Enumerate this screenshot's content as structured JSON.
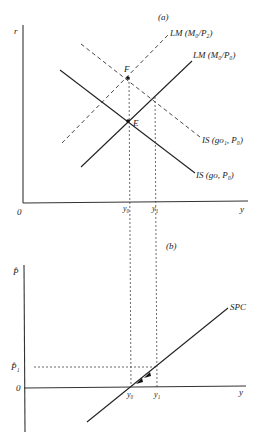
{
  "panel_a": {
    "label": "(a)",
    "y_axis_label": "r",
    "x_axis_label": "y",
    "origin_label": "0",
    "x_ticks": [
      "y₀",
      "y₁"
    ],
    "curves": {
      "lm_p2": "LM (M₀/P₂)",
      "lm_p0": "LM (M₀/P₀)",
      "is_go1": "IS (go₁, P₀)",
      "is_go": "IS (go, P₀)"
    },
    "points": {
      "F": "F",
      "E": "E"
    }
  },
  "panel_b": {
    "label": "(b)",
    "y_axis_label": "P̂",
    "x_axis_label": "y",
    "origin_label": "0",
    "y_tick": "P̂₁",
    "x_ticks": [
      "y₀",
      "y₁"
    ],
    "curve": "SPC"
  },
  "colors": {
    "ink": "#222222",
    "background": "#ffffff"
  }
}
